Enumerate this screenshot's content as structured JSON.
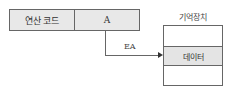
{
  "instruction": {
    "opcode_label": "연산 코드",
    "address_label": "A"
  },
  "arrow": {
    "label": "EA"
  },
  "memory": {
    "title": "기억장치",
    "data_label": "데이터"
  },
  "colors": {
    "box_fill": "#e8e8e8",
    "line": "#666666",
    "background": "#ffffff"
  }
}
